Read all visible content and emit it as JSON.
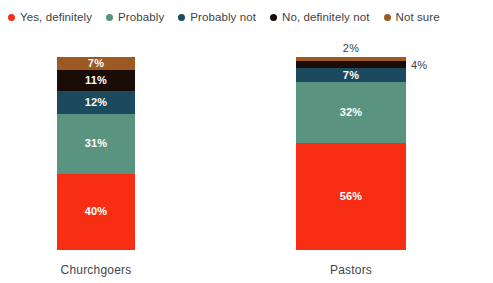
{
  "chart_data": {
    "type": "bar",
    "subtype": "stacked-100-percent",
    "title": "",
    "xlabel": "",
    "ylabel": "",
    "ylim": [
      0,
      100
    ],
    "grid": false,
    "legend_position": "top-left",
    "categories": [
      "Churchgoers",
      "Pastors"
    ],
    "series": [
      {
        "name": "Yes, definitely",
        "color": "#f72e14",
        "values": [
          40,
          56
        ],
        "labels": [
          "40%",
          "56%"
        ]
      },
      {
        "name": "Probably",
        "color": "#5a9480",
        "values": [
          31,
          32
        ],
        "labels": [
          "31%",
          "32%"
        ]
      },
      {
        "name": "Probably not",
        "color": "#1b4a5e",
        "values": [
          12,
          7
        ],
        "labels": [
          "12%",
          "7%"
        ]
      },
      {
        "name": "No, definitely not",
        "color": "#1a0d08",
        "values": [
          11,
          4
        ],
        "labels": [
          "11%",
          "4%"
        ]
      },
      {
        "name": "Not sure",
        "color": "#9c5a22",
        "values": [
          7,
          2
        ],
        "labels": [
          "7%",
          "2%"
        ]
      }
    ]
  },
  "legend": {
    "items": [
      {
        "label": "Yes, definitely",
        "color": "#f72e14",
        "icon": "legend-dot-icon"
      },
      {
        "label": "Probably",
        "color": "#5a9480",
        "icon": "legend-dot-icon"
      },
      {
        "label": "Probably not",
        "color": "#1b4a5e",
        "icon": "legend-dot-icon"
      },
      {
        "label": "No, definitely not",
        "color": "#1a0d08",
        "icon": "legend-dot-icon"
      },
      {
        "label": "Not sure",
        "color": "#9c5a22",
        "icon": "legend-dot-icon"
      }
    ]
  },
  "bars": [
    {
      "category": "Churchgoers",
      "segments": [
        {
          "series": "Not sure",
          "value": 7,
          "label": "7%",
          "color": "#9c5a22",
          "label_placement": "inside"
        },
        {
          "series": "No, definitely not",
          "value": 11,
          "label": "11%",
          "color": "#1a0d08",
          "label_placement": "inside"
        },
        {
          "series": "Probably not",
          "value": 12,
          "label": "12%",
          "color": "#1b4a5e",
          "label_placement": "inside"
        },
        {
          "series": "Probably",
          "value": 31,
          "label": "31%",
          "color": "#5a9480",
          "label_placement": "inside"
        },
        {
          "series": "Yes, definitely",
          "value": 40,
          "label": "40%",
          "color": "#f72e14",
          "label_placement": "inside"
        }
      ]
    },
    {
      "category": "Pastors",
      "segments": [
        {
          "series": "Not sure",
          "value": 2,
          "label": "2%",
          "color": "#9c5a22",
          "label_placement": "outside-top"
        },
        {
          "series": "No, definitely not",
          "value": 4,
          "label": "4%",
          "color": "#1a0d08",
          "label_placement": "outside-right"
        },
        {
          "series": "Probably not",
          "value": 7,
          "label": "7%",
          "color": "#1b4a5e",
          "label_placement": "inside"
        },
        {
          "series": "Probably",
          "value": 32,
          "label": "32%",
          "color": "#5a9480",
          "label_placement": "inside"
        },
        {
          "series": "Yes, definitely",
          "value": 56,
          "label": "56%",
          "color": "#f72e14",
          "label_placement": "inside"
        }
      ]
    }
  ]
}
